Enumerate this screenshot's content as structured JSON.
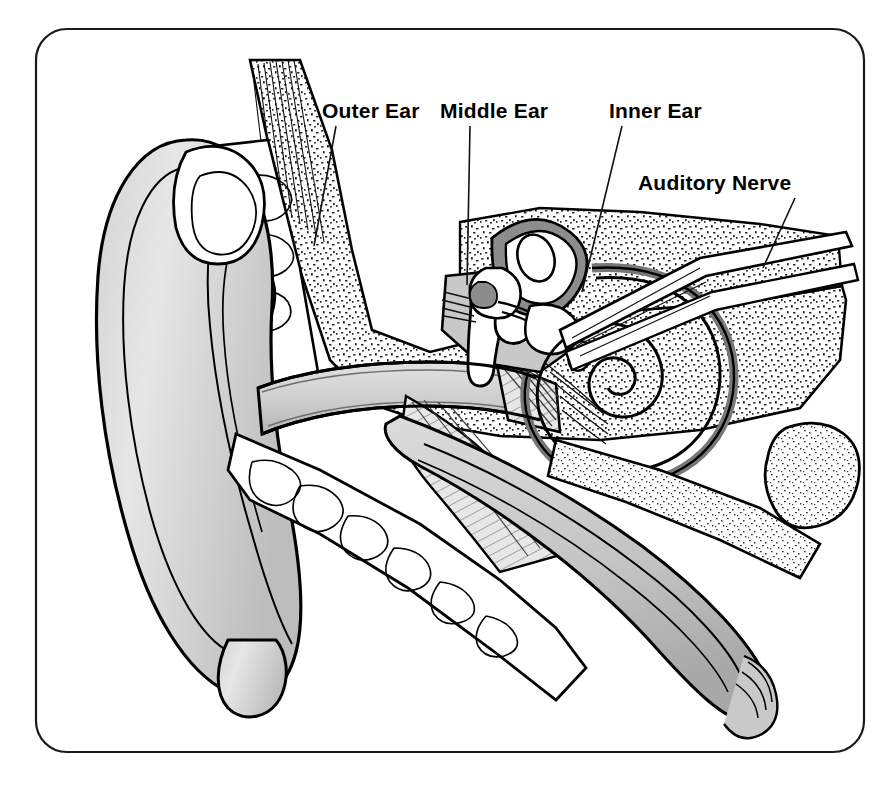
{
  "page": {
    "background_color": "#ffffff",
    "width": 883,
    "height": 789
  },
  "frame": {
    "name": "rounded-border",
    "x": 35,
    "y": 28,
    "width": 830,
    "height": 725,
    "corner_radius": 32,
    "stroke_color": "#1a1a1a"
  },
  "palette": {
    "ink": "#000000",
    "tissue_light": "#e9e9e9",
    "tissue_mid": "#cfcfcf",
    "tissue_dark": "#9a9a9a",
    "channel_dark": "#777777",
    "bone_fill": "#ffffff",
    "label_color": "#000000"
  },
  "labels": [
    {
      "id": "outer-ear",
      "text": "Outer Ear",
      "x": 322,
      "y": 118,
      "leader": {
        "x1": 336,
        "y1": 126,
        "x2": 314,
        "y2": 246
      }
    },
    {
      "id": "middle-ear",
      "text": "Middle Ear",
      "x": 440,
      "y": 118,
      "leader": {
        "x1": 470,
        "y1": 126,
        "x2": 467,
        "y2": 285
      }
    },
    {
      "id": "inner-ear",
      "text": "Inner Ear",
      "x": 609,
      "y": 118,
      "leader": {
        "x1": 622,
        "y1": 126,
        "x2": 582,
        "y2": 292
      }
    },
    {
      "id": "auditory-nerve",
      "text": "Auditory Nerve",
      "x": 638,
      "y": 190,
      "leader": {
        "x1": 795,
        "y1": 198,
        "x2": 763,
        "y2": 268
      }
    }
  ],
  "structures": [
    {
      "id": "pinna",
      "label": "Pinna (auricle)"
    },
    {
      "id": "ear-canal",
      "label": "External auditory canal"
    },
    {
      "id": "eardrum",
      "label": "Tympanic membrane"
    },
    {
      "id": "ossicles",
      "label": "Malleus, incus, stapes"
    },
    {
      "id": "semicircular-canals",
      "label": "Semicircular canals"
    },
    {
      "id": "cochlea",
      "label": "Cochlea"
    },
    {
      "id": "auditory-nerve-bundle",
      "label": "Auditory nerve"
    },
    {
      "id": "eustachian-tube",
      "label": "Eustachian tube"
    },
    {
      "id": "temporal-bone",
      "label": "Temporal bone"
    }
  ]
}
